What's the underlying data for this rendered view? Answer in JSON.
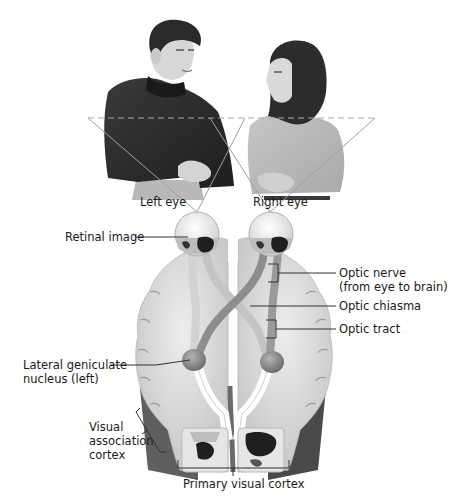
{
  "figure": {
    "scene": {
      "people": [
        {
          "name": "man",
          "position": "left",
          "shirt_color": "#2b2b2b"
        },
        {
          "name": "woman",
          "position": "right",
          "shirt_color": "#b9b9b9"
        }
      ],
      "visual_field_line": "dashed horizontal"
    },
    "labels": {
      "left_eye": "Left eye",
      "right_eye": "Right eye",
      "retinal_image": "Retinal image",
      "optic_nerve": "Optic nerve\n(from eye to brain)",
      "optic_chiasma": "Optic chiasma",
      "optic_tract": "Optic tract",
      "lgn": "Lateral geniculate\nnucleus (left)",
      "visual_association_cortex": "Visual\nassociation\ncortex",
      "primary_visual_cortex": "Primary visual cortex"
    },
    "colors": {
      "brain_fill": "#dcdcdc",
      "brain_shadow": "#6e6e6e",
      "nerve_light": "#c9c9c9",
      "nerve_dark": "#8a8a8a",
      "leader_line": "#333333",
      "dashed_line": "#a8a8a8"
    }
  }
}
